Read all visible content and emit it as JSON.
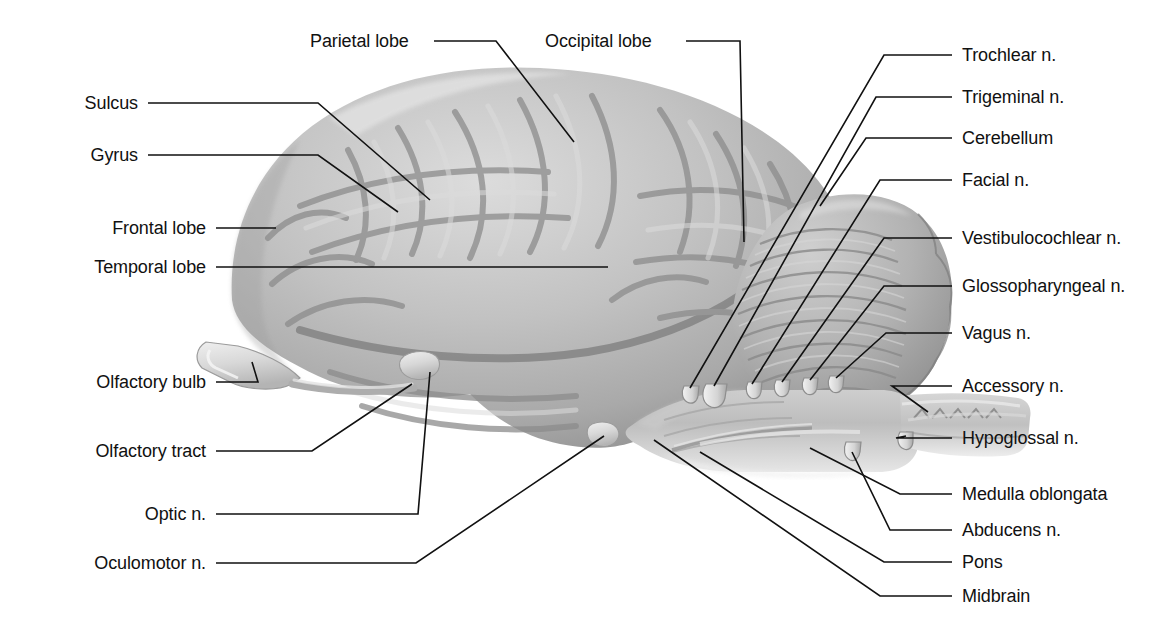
{
  "figure": {
    "background_color": "#ffffff",
    "ink_color": "#111111",
    "brain_fill_light": "#d2d2d2",
    "brain_fill_mid": "#b0b0b0",
    "brain_fill_dark": "#8e8e8e",
    "leader_color": "#111111"
  },
  "labels_left": [
    {
      "id": "sulcus",
      "text": "Sulcus",
      "text_x": 138,
      "text_y": 103
    },
    {
      "id": "gyrus",
      "text": "Gyrus",
      "text_x": 138,
      "text_y": 155
    },
    {
      "id": "frontal-lobe",
      "text": "Frontal lobe",
      "text_x": 206,
      "text_y": 228
    },
    {
      "id": "temporal-lobe",
      "text": "Temporal lobe",
      "text_x": 206,
      "text_y": 267
    },
    {
      "id": "olfactory-bulb",
      "text": "Olfactory bulb",
      "text_x": 206,
      "text_y": 382
    },
    {
      "id": "olfactory-tract",
      "text": "Olfactory tract",
      "text_x": 206,
      "text_y": 451
    },
    {
      "id": "optic-n",
      "text": "Optic n.",
      "text_x": 206,
      "text_y": 514
    },
    {
      "id": "oculomotor-n",
      "text": "Oculomotor n.",
      "text_x": 206,
      "text_y": 563
    }
  ],
  "labels_top": [
    {
      "id": "parietal-lobe",
      "text": "Parietal lobe",
      "text_x": 310,
      "text_y": 41
    },
    {
      "id": "occipital-lobe",
      "text": "Occipital lobe",
      "text_x": 545,
      "text_y": 41
    }
  ],
  "labels_right": [
    {
      "id": "trochlear-n",
      "text": "Trochlear n.",
      "text_x": 962,
      "text_y": 55
    },
    {
      "id": "trigeminal-n",
      "text": "Trigeminal n.",
      "text_x": 962,
      "text_y": 97
    },
    {
      "id": "cerebellum",
      "text": "Cerebellum",
      "text_x": 962,
      "text_y": 138
    },
    {
      "id": "facial-n",
      "text": "Facial n.",
      "text_x": 962,
      "text_y": 180
    },
    {
      "id": "vestibulocochlear-n",
      "text": "Vestibulocochlear n.",
      "text_x": 962,
      "text_y": 238
    },
    {
      "id": "glossopharyngeal-n",
      "text": "Glossopharyngeal n.",
      "text_x": 962,
      "text_y": 286
    },
    {
      "id": "vagus-n",
      "text": "Vagus n.",
      "text_x": 962,
      "text_y": 333
    },
    {
      "id": "accessory-n",
      "text": "Accessory n.",
      "text_x": 962,
      "text_y": 386
    },
    {
      "id": "hypoglossal-n",
      "text": "Hypoglossal n.",
      "text_x": 962,
      "text_y": 438
    },
    {
      "id": "medulla-oblongata",
      "text": "Medulla oblongata",
      "text_x": 962,
      "text_y": 494
    },
    {
      "id": "abducens-n",
      "text": "Abducens n.",
      "text_x": 962,
      "text_y": 530
    },
    {
      "id": "pons",
      "text": "Pons",
      "text_x": 962,
      "text_y": 562
    },
    {
      "id": "midbrain",
      "text": "Midbrain",
      "text_x": 962,
      "text_y": 596
    }
  ],
  "structures": [
    {
      "id": "cerebrum",
      "name": "cerebrum"
    },
    {
      "id": "cerebellum-body",
      "name": "cerebellum"
    },
    {
      "id": "brainstem",
      "name": "brainstem"
    },
    {
      "id": "olfactory-bulb-s",
      "name": "olfactory bulb"
    },
    {
      "id": "spinal-cord",
      "name": "spinal cord"
    }
  ]
}
